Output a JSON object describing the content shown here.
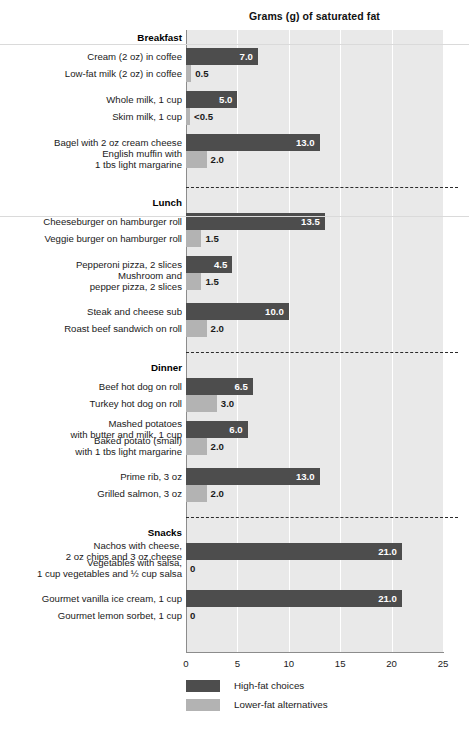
{
  "chart_data": {
    "type": "bar",
    "title": "Grams (g) of saturated fat",
    "orientation": "horizontal",
    "xlabel": "",
    "ylabel": "",
    "xlim": [
      0,
      25
    ],
    "xticks": [
      "0",
      "5",
      "10",
      "15",
      "20",
      "25"
    ],
    "grid": true,
    "legend_position": "bottom-left",
    "legend": [
      {
        "label": "High-fat choices",
        "color": "#4d4d4d",
        "key": "high"
      },
      {
        "label": "Lower-fat alternatives",
        "color": "#b3b3b3",
        "key": "low"
      }
    ],
    "sections": [
      {
        "name": "Breakfast",
        "rows": [
          {
            "label": "Cream (2 oz) in coffee",
            "value": 7.0,
            "value_label": "7.0",
            "series": "high"
          },
          {
            "label": "Low-fat milk (2 oz) in coffee",
            "value": 0.5,
            "value_label": "0.5",
            "series": "low"
          },
          {
            "label": "Whole milk, 1 cup",
            "value": 5.0,
            "value_label": "5.0",
            "series": "high"
          },
          {
            "label": "Skim milk, 1 cup",
            "value": 0.4,
            "value_label": "<0.5",
            "series": "low"
          },
          {
            "label": "Bagel with 2 oz cream cheese",
            "value": 13.0,
            "value_label": "13.0",
            "series": "high"
          },
          {
            "label": "English muffin with\n1 tbs light margarine",
            "value": 2.0,
            "value_label": "2.0",
            "series": "low"
          }
        ]
      },
      {
        "name": "Lunch",
        "rows": [
          {
            "label": "Cheeseburger on hamburger roll",
            "value": 13.5,
            "value_label": "13.5",
            "series": "high"
          },
          {
            "label": "Veggie burger on hamburger roll",
            "value": 1.5,
            "value_label": "1.5",
            "series": "low"
          },
          {
            "label": "Pepperoni pizza, 2 slices",
            "value": 4.5,
            "value_label": "4.5",
            "series": "high"
          },
          {
            "label": "Mushroom and\npepper pizza, 2 slices",
            "value": 1.5,
            "value_label": "1.5",
            "series": "low"
          },
          {
            "label": "Steak and cheese sub",
            "value": 10.0,
            "value_label": "10.0",
            "series": "high"
          },
          {
            "label": "Roast beef sandwich on roll",
            "value": 2.0,
            "value_label": "2.0",
            "series": "low"
          }
        ]
      },
      {
        "name": "Dinner",
        "rows": [
          {
            "label": "Beef hot dog on roll",
            "value": 6.5,
            "value_label": "6.5",
            "series": "high"
          },
          {
            "label": "Turkey hot dog on roll",
            "value": 3.0,
            "value_label": "3.0",
            "series": "low"
          },
          {
            "label": "Mashed potatoes\nwith butter and milk, 1 cup",
            "value": 6.0,
            "value_label": "6.0",
            "series": "high"
          },
          {
            "label": "Baked potato (small)\nwith 1 tbs light margarine",
            "value": 2.0,
            "value_label": "2.0",
            "series": "low"
          },
          {
            "label": "Prime rib, 3 oz",
            "value": 13.0,
            "value_label": "13.0",
            "series": "high"
          },
          {
            "label": "Grilled salmon, 3 oz",
            "value": 2.0,
            "value_label": "2.0",
            "series": "low"
          }
        ]
      },
      {
        "name": "Snacks",
        "rows": [
          {
            "label": "Nachos with cheese,\n2 oz chips and 3 oz cheese",
            "value": 21.0,
            "value_label": "21.0",
            "series": "high"
          },
          {
            "label": "Vegetables with salsa,\n1 cup vegetables and ½ cup salsa",
            "value": 0,
            "value_label": "0",
            "series": "low"
          },
          {
            "label": "Gourmet vanilla ice cream, 1 cup",
            "value": 21.0,
            "value_label": "21.0",
            "series": "high"
          },
          {
            "label": "Gourmet lemon sorbet, 1 cup",
            "value": 0,
            "value_label": "0",
            "series": "low"
          }
        ]
      }
    ]
  },
  "colors": {
    "high_fat": "#4d4d4d",
    "lower_fat": "#b3b3b3",
    "plot_background": "#e9e9e9",
    "gridline": "#ffffff",
    "axis": "#8c8c8c"
  }
}
